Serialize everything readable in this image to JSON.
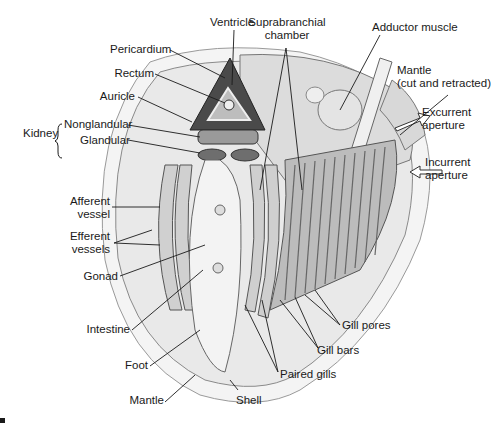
{
  "figure": {
    "corner_mark": "▪"
  },
  "labels": {
    "ventricle": "Ventricle",
    "suprabranchial_1": "Suprabranchial",
    "suprabranchial_2": "chamber",
    "adductor": "Adductor muscle",
    "pericardium": "Pericardium",
    "rectum": "Rectum",
    "auricle": "Auricle",
    "mantle_cut_1": "Mantle",
    "mantle_cut_2": "(cut and retracted)",
    "kidney": "Kidney",
    "nonglandular": "Nonglandular",
    "glandular": "Glandular",
    "excurrent_1": "Excurrent",
    "excurrent_2": "aperture",
    "incurrent_1": "Incurrent",
    "incurrent_2": "aperture",
    "afferent_1": "Afferent",
    "afferent_2": "vessel",
    "efferent_1": "Efferent",
    "efferent_2": "vessels",
    "gonad": "Gonad",
    "intestine": "Intestine",
    "foot": "Foot",
    "mantle": "Mantle",
    "shell": "Shell",
    "gill_pores": "Gill pores",
    "gill_bars": "Gill bars",
    "paired_gills": "Paired gills"
  },
  "colors": {
    "ink": "#1a1a1a",
    "tissue_light": "#e8e8e8",
    "tissue_mid": "#bdbdbd",
    "tissue_dark": "#5a5a5a",
    "shell": "#f2f2f2"
  }
}
